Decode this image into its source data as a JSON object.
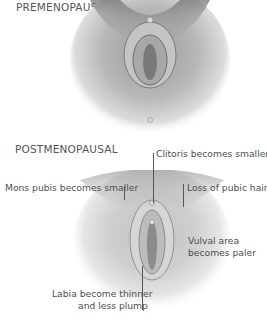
{
  "figures": [
    {
      "title": "PREMENOPAUSAL",
      "illustration": "premenopausal-vulva-illustration"
    },
    {
      "title": "POSTMENOPAUSAL",
      "illustration": "postmenopausal-vulva-illustration",
      "annotations": [
        {
          "text": "Clitoris becomes smaller"
        },
        {
          "text": "Mons pubis becomes smaller"
        },
        {
          "text": "Loss of pubic hair"
        },
        {
          "text": "Vulval area"
        },
        {
          "text": "becomes paler"
        },
        {
          "text": "Labia become thinner"
        },
        {
          "text": "and less plump"
        }
      ]
    }
  ]
}
